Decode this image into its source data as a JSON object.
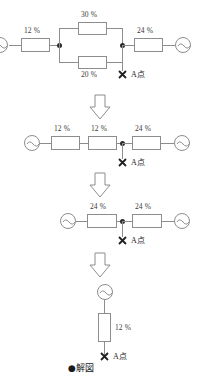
{
  "figure": {
    "caption": "●解図",
    "point_label": "A点",
    "icons": {
      "ac_source": "ac-source-icon",
      "fault_mark": "x-cross-icon",
      "step_arrow": "down-arrow-icon"
    }
  },
  "stages": [
    {
      "id": "stage-1",
      "series_left": "12 %",
      "parallel_top": "30 %",
      "parallel_bottom": "20 %",
      "series_right": "24 %",
      "point_label": "A点"
    },
    {
      "id": "stage-2",
      "r1": "12 %",
      "r2": "12 %",
      "r3": "24 %",
      "point_label": "A点"
    },
    {
      "id": "stage-3",
      "r1": "24 %",
      "r2": "24 %",
      "point_label": "A点"
    },
    {
      "id": "stage-4",
      "r1": "12 %",
      "point_label": "A点"
    }
  ]
}
